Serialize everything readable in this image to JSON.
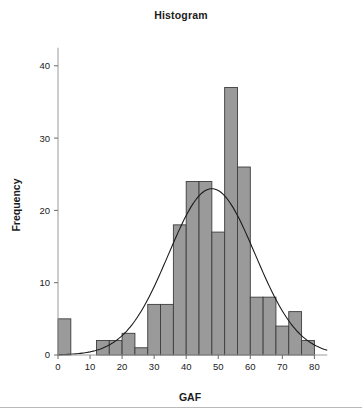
{
  "chart_data": {
    "type": "bar",
    "title": "Histogram",
    "xlabel": "GAF",
    "ylabel": "Frequency",
    "xlim": [
      0,
      84
    ],
    "ylim": [
      0,
      43
    ],
    "grid": false,
    "legend": null,
    "bin_width": 4,
    "bin_starts": [
      0,
      12,
      16,
      20,
      24,
      28,
      32,
      36,
      40,
      44,
      48,
      52,
      56,
      60,
      64,
      68,
      72,
      76
    ],
    "bin_centers": [
      2,
      14,
      18,
      22,
      26,
      30,
      34,
      38,
      42,
      46,
      50,
      54,
      58,
      62,
      66,
      70,
      74,
      78
    ],
    "values": [
      5,
      2,
      2,
      3,
      1,
      7,
      7,
      18,
      24,
      24,
      17,
      37,
      26,
      8,
      8,
      4,
      6,
      2
    ],
    "bar_fill": "#9a9a9a",
    "bar_edge": "#3d3d3d",
    "curve": {
      "label": "normal-density-overlay",
      "color": "#1b1b1b",
      "peak_x": 48,
      "peak_y": 23,
      "mean": 48,
      "sd": 13.5
    },
    "xticks": [
      {
        "value": 0,
        "label": "0"
      },
      {
        "value": 10,
        "label": "10"
      },
      {
        "value": 20,
        "label": "20"
      },
      {
        "value": 30,
        "label": "30"
      },
      {
        "value": 40,
        "label": "40"
      },
      {
        "value": 50,
        "label": "50"
      },
      {
        "value": 60,
        "label": "60"
      },
      {
        "value": 70,
        "label": "70"
      },
      {
        "value": 80,
        "label": "80"
      }
    ],
    "yticks": [
      {
        "value": 0,
        "label": "0"
      },
      {
        "value": 10,
        "label": "10"
      },
      {
        "value": 20,
        "label": "20"
      },
      {
        "value": 30,
        "label": "30"
      },
      {
        "value": 40,
        "label": "40"
      }
    ]
  },
  "figure": {
    "title": "Histogram",
    "background": "#ffffff",
    "rule_color": "#b9b9b9"
  }
}
